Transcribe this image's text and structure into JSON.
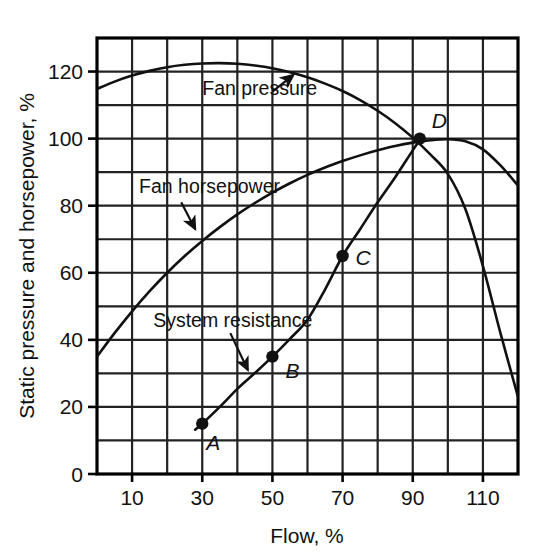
{
  "chart_data": {
    "type": "line",
    "title": "",
    "xlabel": "Flow, %",
    "ylabel": "Static pressure and horsepower, %",
    "xlim": [
      0,
      120
    ],
    "ylim": [
      0,
      130
    ],
    "xticks": [
      10,
      30,
      50,
      70,
      90,
      110
    ],
    "xtick_labels": [
      "10",
      "30",
      "50",
      "70",
      "90",
      "110"
    ],
    "yticks": [
      0,
      20,
      40,
      60,
      80,
      100,
      120
    ],
    "ytick_labels": [
      "0",
      "20",
      "40",
      "60",
      "80",
      "100",
      "120"
    ],
    "grid": true,
    "grid_x_step": 10,
    "grid_y_step": 10,
    "legend_position": "inline-annotations",
    "series": [
      {
        "name": "Fan pressure",
        "label": "Fan pressure",
        "label_x": 30,
        "label_y": 115,
        "arrow_from_x": 50,
        "arrow_from_y": 114,
        "arrow_to_x": 56,
        "arrow_to_y": 119,
        "x": [
          0,
          5,
          10,
          15,
          20,
          25,
          30,
          35,
          40,
          45,
          50,
          55,
          60,
          65,
          70,
          75,
          80,
          85,
          90,
          95,
          100,
          105,
          110,
          115,
          120
        ],
        "y": [
          114.8,
          117.0,
          118.8,
          120.2,
          121.3,
          122.0,
          122.4,
          122.5,
          122.3,
          121.8,
          121.0,
          119.8,
          118.3,
          116.4,
          114.2,
          111.5,
          108.3,
          104.6,
          100.3,
          95.3,
          89.5,
          79.0,
          62.0,
          42.0,
          23.0
        ]
      },
      {
        "name": "Fan horsepower",
        "label": "Fan horsepower",
        "label_x": 12,
        "label_y": 86,
        "arrow_from_x": 24,
        "arrow_from_y": 81,
        "arrow_to_x": 28,
        "arrow_to_y": 73,
        "x": [
          0,
          5,
          10,
          15,
          20,
          25,
          30,
          35,
          40,
          45,
          50,
          55,
          60,
          65,
          70,
          75,
          80,
          85,
          90,
          95,
          100,
          105,
          110,
          115,
          120
        ],
        "y": [
          35.0,
          42.0,
          48.5,
          54.5,
          60.0,
          65.0,
          69.5,
          73.6,
          77.4,
          80.8,
          83.9,
          86.7,
          89.2,
          91.4,
          93.3,
          95.0,
          96.5,
          97.8,
          98.8,
          99.5,
          99.8,
          99.2,
          96.8,
          92.0,
          86.0
        ]
      },
      {
        "name": "System resistance",
        "label": "System resistance",
        "label_x": 16,
        "label_y": 46,
        "arrow_from_x": 38,
        "arrow_from_y": 42,
        "arrow_to_x": 43,
        "arrow_to_y": 31,
        "x": [
          28,
          30,
          35,
          40,
          45,
          50,
          55,
          60,
          65,
          70,
          75,
          80,
          85,
          90,
          92
        ],
        "y": [
          13.2,
          15.0,
          20.0,
          25.4,
          30.1,
          35.0,
          40.3,
          46.0,
          55.0,
          65.0,
          73.0,
          81.0,
          88.5,
          96.5,
          99.5
        ]
      }
    ],
    "points": [
      {
        "label": "A",
        "x": 30,
        "y": 15,
        "label_dx": 4,
        "label_dy": 26
      },
      {
        "label": "B",
        "x": 50,
        "y": 35,
        "label_dx": 13,
        "label_dy": 21
      },
      {
        "label": "C",
        "x": 70,
        "y": 65,
        "label_dx": 13,
        "label_dy": 9
      },
      {
        "label": "D",
        "x": 92,
        "y": 100,
        "label_dx": 12,
        "label_dy": -11
      }
    ]
  },
  "colors": {
    "ink": "#111111",
    "grid": "#222222",
    "frame": "#000000",
    "background": "#ffffff"
  }
}
